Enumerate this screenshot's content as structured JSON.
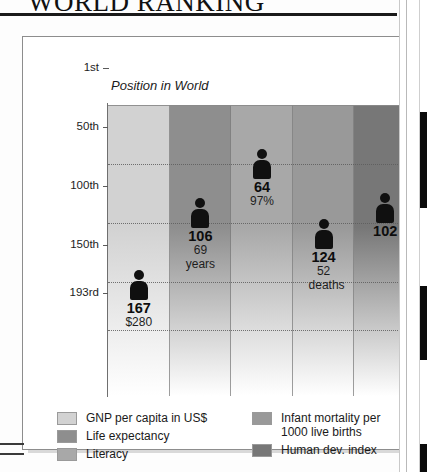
{
  "page": {
    "title": "WORLD RANKING"
  },
  "chart_data": {
    "type": "bar",
    "title": "WORLD RANKING",
    "ylabel": "Position in World",
    "xlabel": "",
    "grid": true,
    "legend_position": "bottom",
    "y_axis": {
      "label": "Position in World",
      "ticks": [
        "1st",
        "50th",
        "100th",
        "150th",
        "193rd"
      ],
      "tick_values": [
        1,
        50,
        100,
        150,
        193
      ],
      "range_top": 1,
      "range_bottom": 193,
      "direction": "inverted"
    },
    "categories": [
      "GNP per capita in US$",
      "Life expectancy",
      "Literacy",
      "Infant mortality per 1000 live births",
      "Human dev. index"
    ],
    "values": [
      167,
      106,
      64,
      124,
      102
    ],
    "series": [
      {
        "name": "World ranking position",
        "values": [
          167,
          106,
          64,
          124,
          102
        ]
      }
    ],
    "points": [
      {
        "category": "GNP per capita in US$",
        "rank": "167",
        "rank_value": 167,
        "detail": "$280",
        "detail_lines": [
          "$280"
        ],
        "color": "#d2d2d2"
      },
      {
        "category": "Life expectancy",
        "rank": "106",
        "rank_value": 106,
        "detail": "69 years",
        "detail_lines": [
          "69",
          "years"
        ],
        "color": "#8e8e8e"
      },
      {
        "category": "Literacy",
        "rank": "64",
        "rank_value": 64,
        "detail": "97%",
        "detail_lines": [
          "97%"
        ],
        "color": "#a8a8a8"
      },
      {
        "category": "Infant mortality per 1000 live births",
        "rank": "124",
        "rank_value": 124,
        "detail": "52 deaths",
        "detail_lines": [
          "52",
          "deaths"
        ],
        "color": "#999999"
      },
      {
        "category": "Human dev. index",
        "rank": "102",
        "rank_value": 102,
        "detail": "",
        "detail_lines": [],
        "color": "#777777"
      }
    ]
  },
  "legend": {
    "left": [
      {
        "label": "GNP per capita in US$",
        "color": "#d2d2d2"
      },
      {
        "label": "Life expectancy",
        "color": "#8e8e8e"
      },
      {
        "label": "Literacy",
        "color": "#a8a8a8"
      }
    ],
    "right": [
      {
        "label": "Infant mortality per\n1000 live births",
        "line1": "Infant mortality per",
        "line2": "1000 live births",
        "color": "#999999"
      },
      {
        "label": "Human dev. index",
        "line1": "Human dev. index",
        "line2": "",
        "color": "#777777"
      }
    ]
  }
}
